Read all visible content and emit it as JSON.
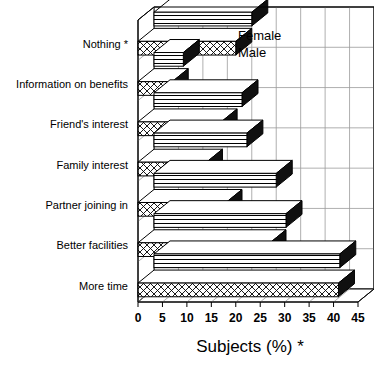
{
  "chart_data": {
    "type": "bar",
    "orientation": "horizontal",
    "title": "",
    "xlabel": "Subjects (%) *",
    "ylabel": "",
    "xlim": [
      0,
      45
    ],
    "xticks": [
      0,
      5,
      10,
      15,
      20,
      25,
      30,
      35,
      40,
      45
    ],
    "grid": true,
    "legend_position": "top-right",
    "categories": [
      "More time",
      "Better facilities",
      "Partner joining in",
      "Family interest",
      "Friend's interest",
      "Information on benefits",
      "Nothing *"
    ],
    "series": [
      {
        "name": "Female",
        "pattern": "horizontal-lines",
        "values": [
          38,
          27,
          25,
          19,
          18,
          6,
          20
        ]
      },
      {
        "name": "Male",
        "pattern": "cross-hatch",
        "values": [
          41,
          27,
          18,
          14,
          17,
          7,
          20
        ]
      }
    ]
  },
  "axis": {
    "x_title": "Subjects (%) *",
    "tick_labels": [
      "0",
      "5",
      "10",
      "15",
      "20",
      "25",
      "30",
      "35",
      "40",
      "45"
    ],
    "category_labels": [
      "Nothing *",
      "Information on benefits",
      "Friend's interest",
      "Family interest",
      "Partner joining in",
      "Better facilities",
      "More time"
    ]
  },
  "legend": {
    "items": [
      {
        "label": "Female",
        "pattern": "horizontal-lines"
      },
      {
        "label": "Male",
        "pattern": "cross-hatch"
      }
    ]
  },
  "colors": {
    "background": "#ffffff",
    "line": "#000000",
    "grid": "#9a9a9a",
    "bar_side_shadow": "#101010"
  }
}
